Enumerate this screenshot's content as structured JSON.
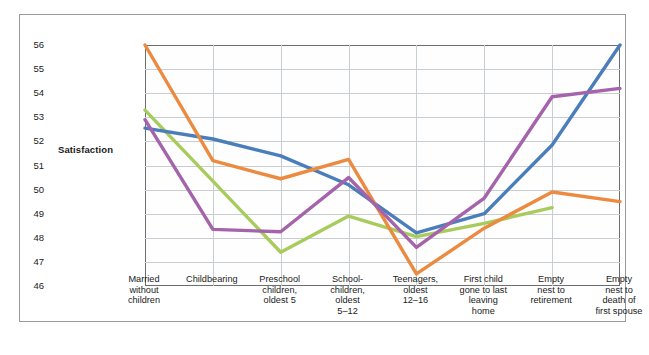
{
  "axis": {
    "ylabel": "Satisfaction",
    "yticks": [
      "56",
      "55",
      "54",
      "53",
      "52",
      "51",
      "50",
      "49",
      "48",
      "47",
      "46"
    ]
  },
  "categories": [
    "Married\nwithout\nchildren",
    "Childbearing",
    "Preschool\nchildren,\noldest 5",
    "School-\nchildren,\noldest\n5–12",
    "Teenagers,\noldest\n12–16",
    "First child\ngone to last\nleaving\nhome",
    "Empty\nnest to\nretirement",
    "Empty\nnest to\ndeath of\nfirst spouse"
  ],
  "colors": {
    "blue": "#4a7ebb",
    "orange": "#ec8b3f",
    "purple": "#a463ab",
    "green": "#a8cc5c",
    "grid": "#c9cdd4",
    "frame": "#6d6d6d",
    "outer_border": "#9a9a9a",
    "text": "#1b1b1b"
  },
  "chart_data": {
    "type": "line",
    "title": "",
    "xlabel": "",
    "ylabel": "Satisfaction",
    "ylim": [
      46,
      56
    ],
    "grid": true,
    "legend": "none",
    "categories": [
      "Married without children",
      "Childbearing",
      "Preschool children, oldest 5",
      "School-children, oldest 5–12",
      "Teenagers, oldest 12–16",
      "First child gone to last leaving home",
      "Empty nest to retirement",
      "Empty nest to death of first spouse"
    ],
    "series": [
      {
        "name": "orange",
        "color": "#ec8b3f",
        "values": [
          56.0,
          51.2,
          50.45,
          51.25,
          46.5,
          48.4,
          49.9,
          49.5
        ]
      },
      {
        "name": "blue",
        "color": "#4a7ebb",
        "values": [
          52.55,
          52.1,
          51.4,
          50.2,
          48.2,
          49.0,
          51.85,
          56.0
        ]
      },
      {
        "name": "purple",
        "color": "#a463ab",
        "values": [
          52.9,
          48.35,
          48.25,
          50.5,
          47.6,
          49.65,
          53.85,
          54.2
        ]
      },
      {
        "name": "green",
        "color": "#a8cc5c",
        "values": [
          53.3,
          50.35,
          47.4,
          48.9,
          48.05,
          48.6,
          49.25,
          null
        ]
      }
    ]
  }
}
